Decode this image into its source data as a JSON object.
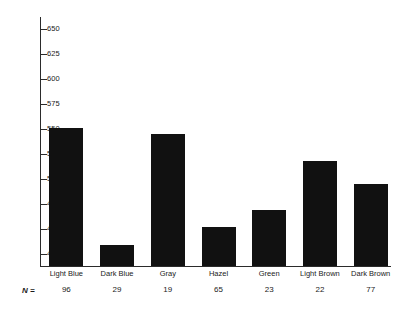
{
  "chart_data": {
    "type": "bar",
    "title": "",
    "xlabel": "",
    "ylabel": "",
    "categories": [
      "Light Blue",
      "Dark Blue",
      "Gray",
      "Hazel",
      "Green",
      "Light Brown",
      "Dark Brown"
    ],
    "values": [
      551,
      434,
      545,
      452,
      469,
      518,
      495
    ],
    "n_values": [
      96,
      29,
      19,
      65,
      23,
      22,
      77
    ],
    "n_label": "N =",
    "ylim": [
      412,
      662
    ],
    "yticks": [
      425,
      450,
      475,
      500,
      525,
      550,
      575,
      600,
      625,
      650
    ],
    "ytick_labels": [
      "425",
      "450",
      "475",
      "500",
      "525",
      "550",
      "575",
      "600",
      "625",
      "650"
    ],
    "grid": false,
    "legend": null,
    "bar_color": "#111111",
    "axis_color": "#2b2b2b"
  }
}
